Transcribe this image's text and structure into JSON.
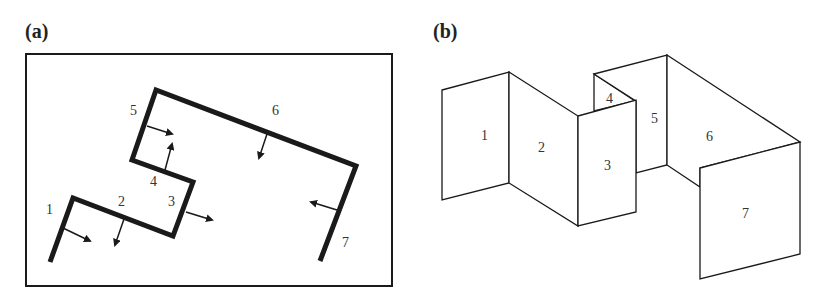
{
  "panel_a": {
    "label": "(a)",
    "frame": {
      "x": 26,
      "y": 54,
      "w": 366,
      "h": 232
    },
    "path_points": [
      [
        50,
        262
      ],
      [
        73,
        198
      ],
      [
        173,
        236
      ],
      [
        193,
        182
      ],
      [
        132,
        160
      ],
      [
        156,
        90
      ],
      [
        356,
        166
      ],
      [
        320,
        261
      ]
    ],
    "segments": [
      {
        "id": "1",
        "label_pos": [
          46,
          214
        ],
        "arrow": [
          [
            63,
            228
          ],
          [
            90,
            241
          ]
        ]
      },
      {
        "id": "2",
        "label_pos": [
          118,
          206
        ],
        "arrow": [
          [
            124,
            219
          ],
          [
            115,
            245
          ]
        ]
      },
      {
        "id": "3",
        "label_pos": [
          168,
          206
        ],
        "arrow": [
          [
            186,
            212
          ],
          [
            212,
            220
          ]
        ]
      },
      {
        "id": "4",
        "label_pos": [
          150,
          186
        ],
        "arrow": [
          [
            165,
            170
          ],
          [
            172,
            144
          ]
        ]
      },
      {
        "id": "5",
        "label_pos": [
          130,
          115
        ],
        "arrow": [
          [
            147,
            126
          ],
          [
            172,
            134
          ]
        ]
      },
      {
        "id": "6",
        "label_pos": [
          272,
          115
        ],
        "arrow": [
          [
            268,
            131
          ],
          [
            259,
            158
          ]
        ]
      },
      {
        "id": "7",
        "label_pos": [
          342,
          247
        ],
        "arrow": [
          [
            337,
            210
          ],
          [
            311,
            202
          ]
        ]
      }
    ]
  },
  "panel_b": {
    "label": "(b)",
    "panels": [
      {
        "id": "1",
        "points": [
          [
            442,
            90
          ],
          [
            509,
            72
          ],
          [
            509,
            183
          ],
          [
            442,
            200
          ]
        ],
        "label_pos": [
          481,
          140
        ]
      },
      {
        "id": "2",
        "points": [
          [
            509,
            72
          ],
          [
            578,
            116
          ],
          [
            578,
            226
          ],
          [
            509,
            183
          ]
        ],
        "label_pos": [
          538,
          152
        ]
      },
      {
        "id": "4",
        "points": [
          [
            594,
            74
          ],
          [
            635,
            101
          ],
          [
            594,
            111
          ]
        ],
        "label_pos": [
          606,
          103
        ]
      },
      {
        "id": "5",
        "points": [
          [
            594,
            74
          ],
          [
            667,
            55
          ],
          [
            667,
            165
          ],
          [
            636,
            173
          ],
          [
            636,
            101
          ]
        ],
        "label_pos": [
          651,
          123
        ]
      },
      {
        "id": "3",
        "points": [
          [
            578,
            116
          ],
          [
            636,
            100
          ],
          [
            636,
            212
          ],
          [
            578,
            226
          ]
        ],
        "label_pos": [
          604,
          170
        ]
      },
      {
        "id": "6",
        "points": [
          [
            667,
            55
          ],
          [
            800,
            142
          ],
          [
            700,
            168
          ],
          [
            700,
            187
          ],
          [
            667,
            165
          ]
        ],
        "label_pos": [
          706,
          141
        ]
      },
      {
        "id": "7",
        "points": [
          [
            700,
            168
          ],
          [
            800,
            142
          ],
          [
            800,
            254
          ],
          [
            700,
            279
          ]
        ],
        "label_pos": [
          742,
          218
        ]
      }
    ]
  },
  "colors": {
    "stroke": "#1a1a1a",
    "text": "#333333",
    "background": "#ffffff"
  }
}
